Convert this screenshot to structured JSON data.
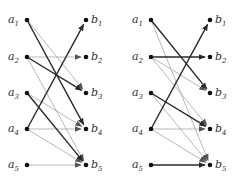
{
  "colors": {
    "thick_edge": "#2a2a2a",
    "thin_edge": "#9a9a9a",
    "node": "#111111",
    "label": "#333333"
  },
  "graphs": [
    {
      "name": "left-graph",
      "a_x": 27,
      "b_x": 86,
      "ys": [
        20,
        57,
        93,
        129,
        165
      ],
      "left_nodes": [
        {
          "base": "a",
          "sub": "1"
        },
        {
          "base": "a",
          "sub": "2"
        },
        {
          "base": "a",
          "sub": "3"
        },
        {
          "base": "a",
          "sub": "4"
        },
        {
          "base": "a",
          "sub": "5"
        }
      ],
      "right_nodes": [
        {
          "base": "b",
          "sub": "1"
        },
        {
          "base": "b",
          "sub": "2"
        },
        {
          "base": "b",
          "sub": "3"
        },
        {
          "base": "b",
          "sub": "4"
        },
        {
          "base": "b",
          "sub": "5"
        }
      ],
      "edges": [
        {
          "from": 1,
          "to": 3,
          "weight": "thin"
        },
        {
          "from": 1,
          "to": 4,
          "weight": "thick"
        },
        {
          "from": 2,
          "to": 2,
          "weight": "thin"
        },
        {
          "from": 2,
          "to": 3,
          "weight": "thick"
        },
        {
          "from": 2,
          "to": 5,
          "weight": "thin"
        },
        {
          "from": 3,
          "to": 4,
          "weight": "thin"
        },
        {
          "from": 3,
          "to": 5,
          "weight": "thick"
        },
        {
          "from": 4,
          "to": 1,
          "weight": "thick"
        },
        {
          "from": 4,
          "to": 4,
          "weight": "thin"
        },
        {
          "from": 4,
          "to": 5,
          "weight": "thin"
        },
        {
          "from": 5,
          "to": 5,
          "weight": "thin"
        }
      ]
    },
    {
      "name": "right-graph",
      "a_x": 151,
      "b_x": 210,
      "ys": [
        20,
        57,
        93,
        129,
        165
      ],
      "left_nodes": [
        {
          "base": "a",
          "sub": "1"
        },
        {
          "base": "a",
          "sub": "2"
        },
        {
          "base": "a",
          "sub": "3"
        },
        {
          "base": "a",
          "sub": "4"
        },
        {
          "base": "a",
          "sub": "5"
        }
      ],
      "right_nodes": [
        {
          "base": "b",
          "sub": "1"
        },
        {
          "base": "b",
          "sub": "2"
        },
        {
          "base": "b",
          "sub": "3"
        },
        {
          "base": "b",
          "sub": "4"
        },
        {
          "base": "b",
          "sub": "5"
        }
      ],
      "edges": [
        {
          "from": 1,
          "to": 3,
          "weight": "thick"
        },
        {
          "from": 1,
          "to": 5,
          "weight": "thin"
        },
        {
          "from": 2,
          "to": 2,
          "weight": "thick"
        },
        {
          "from": 2,
          "to": 3,
          "weight": "thin"
        },
        {
          "from": 2,
          "to": 4,
          "weight": "thin"
        },
        {
          "from": 3,
          "to": 4,
          "weight": "thick"
        },
        {
          "from": 3,
          "to": 5,
          "weight": "thin"
        },
        {
          "from": 4,
          "to": 1,
          "weight": "thick"
        },
        {
          "from": 4,
          "to": 4,
          "weight": "thin"
        },
        {
          "from": 4,
          "to": 5,
          "weight": "thin"
        },
        {
          "from": 5,
          "to": 5,
          "weight": "thick"
        }
      ]
    }
  ]
}
